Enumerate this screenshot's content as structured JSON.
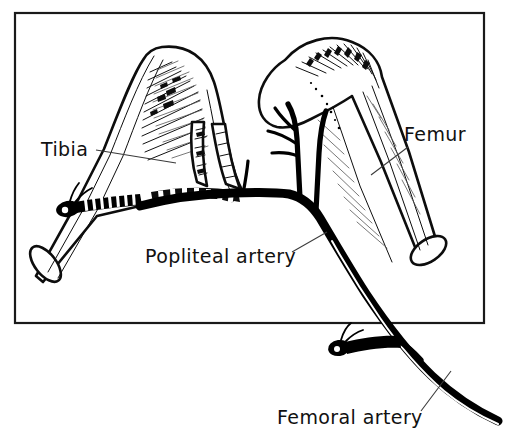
{
  "figure": {
    "frame": {
      "x": 15,
      "y": 13,
      "width": 469,
      "height": 310,
      "stroke_color": "#1a1a1a"
    },
    "background_color": "#ffffff",
    "ink_color": "#000000",
    "leader_color": "#3a3a3a"
  },
  "labels": {
    "tibia": {
      "text": "Tibia",
      "x": 41,
      "y": 156,
      "leader": "M 96,150 L 176,163"
    },
    "femur": {
      "text": "Femur",
      "x": 404,
      "y": 141,
      "leader": "M 408,147 L 371,175"
    },
    "popliteal_artery": {
      "text": "Popliteal artery",
      "x": 145,
      "y": 263,
      "leader": "M 292,252 L 327,232"
    },
    "femoral_artery": {
      "text": "Femoral artery",
      "x": 277,
      "y": 424,
      "leader": "M 421,411 L 451,371"
    }
  },
  "structures": [
    {
      "name": "tibia-bone",
      "kind": "bone",
      "label": "Tibia"
    },
    {
      "name": "femur-bone",
      "kind": "bone",
      "label": "Femur"
    },
    {
      "name": "popliteal-artery-vessel",
      "kind": "artery",
      "label": "Popliteal artery"
    },
    {
      "name": "femoral-artery-vessel",
      "kind": "artery",
      "label": "Femoral artery"
    },
    {
      "name": "genicular-branches",
      "kind": "artery-branches",
      "label": ""
    },
    {
      "name": "ligature-tibial-stump",
      "kind": "ligature",
      "label": ""
    },
    {
      "name": "ligature-femoral-branch-stump",
      "kind": "ligature",
      "label": ""
    }
  ]
}
